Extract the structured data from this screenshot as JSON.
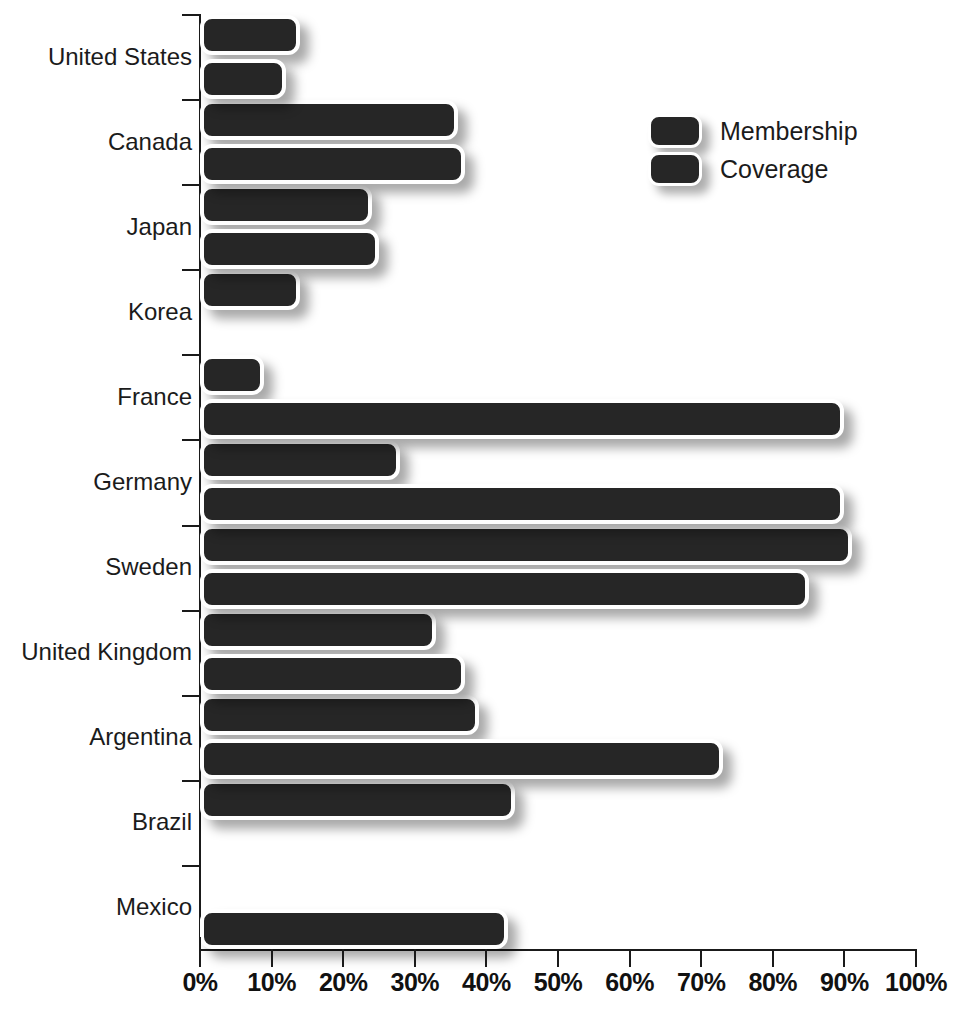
{
  "chart_data": {
    "type": "bar",
    "orientation": "horizontal",
    "title": "",
    "xlabel": "",
    "ylabel": "",
    "xlim": [
      0,
      100
    ],
    "grid": false,
    "legend_position": "top-right",
    "x_tick_labels": [
      "0%",
      "10%",
      "20%",
      "30%",
      "40%",
      "50%",
      "60%",
      "70%",
      "80%",
      "90%",
      "100%"
    ],
    "x_tick_values": [
      0,
      10,
      20,
      30,
      40,
      50,
      60,
      70,
      80,
      90,
      100
    ],
    "categories": [
      "United States",
      "Canada",
      "Japan",
      "Korea",
      "France",
      "Germany",
      "Sweden",
      "United Kingdom",
      "Argentina",
      "Brazil",
      "Mexico"
    ],
    "series": [
      {
        "name": "Membership",
        "color": "#262626",
        "values": [
          14,
          36,
          24,
          14,
          9,
          28,
          91,
          33,
          39,
          44,
          null
        ]
      },
      {
        "name": "Coverage",
        "color": "#262626",
        "values": [
          12,
          37,
          25,
          null,
          90,
          90,
          85,
          37,
          73,
          null,
          43
        ]
      }
    ]
  },
  "legend": {
    "items": [
      {
        "label": "Membership"
      },
      {
        "label": "Coverage"
      }
    ]
  },
  "axes": {
    "x_unit": "%"
  }
}
